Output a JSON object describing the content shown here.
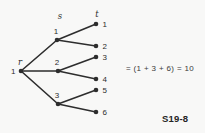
{
  "colors": {
    "ink": "#2d2d2d",
    "background": "#f8f8f7",
    "equation_text": "#3a3a3a"
  },
  "tree": {
    "description": "three-level tree from root r through level s to leaves t",
    "node_radius": 2.3,
    "edge_width": 1.6,
    "nodes": [
      {
        "id": "root",
        "x": 21,
        "y": 71,
        "label": "1",
        "label_pos": "left"
      },
      {
        "id": "s1",
        "x": 57,
        "y": 40,
        "label": "1",
        "label_pos": "above"
      },
      {
        "id": "s2",
        "x": 58,
        "y": 71,
        "label": "2",
        "label_pos": "above"
      },
      {
        "id": "s3",
        "x": 58,
        "y": 104,
        "label": "3",
        "label_pos": "above"
      },
      {
        "id": "t1",
        "x": 96,
        "y": 24,
        "label": "1",
        "label_pos": "right"
      },
      {
        "id": "t2",
        "x": 96,
        "y": 46,
        "label": "2",
        "label_pos": "right"
      },
      {
        "id": "t3",
        "x": 96,
        "y": 57,
        "label": "3",
        "label_pos": "right"
      },
      {
        "id": "t4",
        "x": 96,
        "y": 79,
        "label": "4",
        "label_pos": "right"
      },
      {
        "id": "t5",
        "x": 96,
        "y": 90,
        "label": "5",
        "label_pos": "right"
      },
      {
        "id": "t6",
        "x": 96,
        "y": 112,
        "label": "6",
        "label_pos": "right"
      }
    ],
    "edges": [
      [
        "root",
        "s1"
      ],
      [
        "root",
        "s2"
      ],
      [
        "root",
        "s3"
      ],
      [
        "s1",
        "t1"
      ],
      [
        "s1",
        "t2"
      ],
      [
        "s2",
        "t3"
      ],
      [
        "s2",
        "t4"
      ],
      [
        "s3",
        "t5"
      ],
      [
        "s3",
        "t6"
      ]
    ],
    "level_labels": [
      {
        "text": "r",
        "x": 20,
        "y": 65
      },
      {
        "text": "s",
        "x": 60,
        "y": 19
      },
      {
        "text": "t",
        "x": 97,
        "y": 17
      }
    ]
  },
  "equation": "= (1 + 3 + 6) = 10",
  "figure_label": "S19-8"
}
